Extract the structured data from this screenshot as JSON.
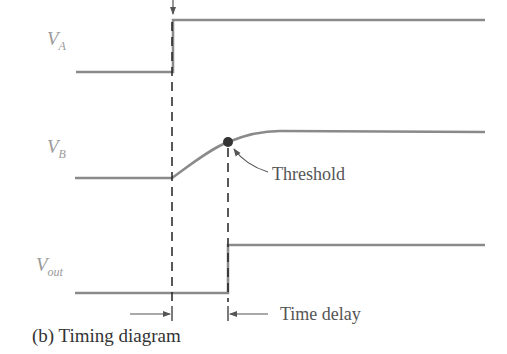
{
  "diagram": {
    "caption": "(b) Timing diagram",
    "signals": [
      {
        "id": "VA",
        "label_main": "V",
        "label_sub": "A",
        "shape": "step",
        "low_y": 72,
        "high_y": 20,
        "transition_x": 173
      },
      {
        "id": "VB",
        "label_main": "V",
        "label_sub": "B",
        "shape": "ramp",
        "low_y": 178,
        "high_y": 132,
        "start_x": 172,
        "end_x": 280
      },
      {
        "id": "Vout",
        "label_main": "V",
        "label_sub": "out",
        "shape": "step",
        "low_y": 293,
        "high_y": 245,
        "transition_x": 228
      }
    ],
    "annotations": {
      "threshold": "Threshold",
      "time_delay": "Time delay"
    },
    "colors": {
      "signal": "#8a8a8a",
      "dash": "#222222",
      "dot": "#333333",
      "label": "#9a9a9a"
    }
  }
}
